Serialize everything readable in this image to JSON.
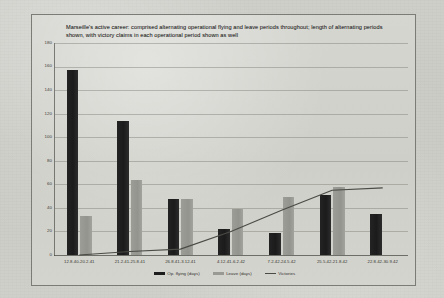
{
  "chart_data": {
    "type": "bar",
    "title": "Marseille's active career: comprised alternating operational flying and leave periods throughout; length of alternating periods shown, with victory claims in each operational period shown as well",
    "xlabel": "",
    "ylabel": "",
    "ylim": [
      0,
      180
    ],
    "yticks": [
      0,
      20,
      40,
      60,
      80,
      100,
      120,
      140,
      160,
      180
    ],
    "grid": true,
    "legend_position": "bottom",
    "categories": [
      "12.8.40-20.2.41",
      "21.2.41-25.8.41",
      "26.8.41-3.12.41",
      "4.12.41-6.2.42",
      "7.2.42-24.5.42",
      "25.5.42-21.8.42",
      "22.8.42-30.9.42"
    ],
    "series": [
      {
        "name": "Op. flying (days)",
        "kind": "bar",
        "color": "#1d1d1d",
        "values": [
          157,
          114,
          48,
          22,
          19,
          51,
          35
        ]
      },
      {
        "name": "Leave (days)",
        "kind": "bar",
        "color": "#9a9a95",
        "values": [
          33,
          64,
          48,
          39,
          49,
          58,
          null
        ]
      },
      {
        "name": "Victories",
        "kind": "line",
        "color": "#4a4a46",
        "values": [
          0,
          3,
          5,
          20,
          38,
          55,
          57
        ]
      }
    ]
  },
  "legend": {
    "items": [
      {
        "label": "Op. flying (days)",
        "swatch": "flying"
      },
      {
        "label": "Leave (days)",
        "swatch": "leave"
      },
      {
        "label": "Victories",
        "swatch": "line"
      }
    ]
  }
}
